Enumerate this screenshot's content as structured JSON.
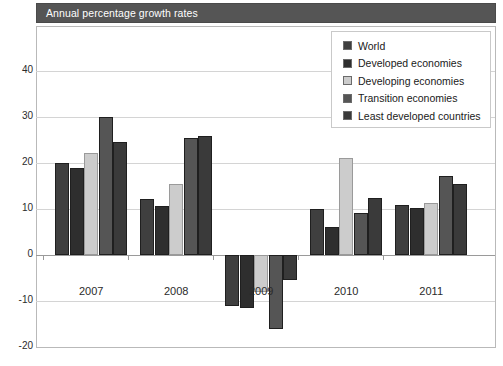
{
  "title": "Annual percentage growth rates",
  "legend": {
    "position": "top-right",
    "items": [
      {
        "label": "World",
        "color": "#3f3f3f"
      },
      {
        "label": "Developed economies",
        "color": "#2e2e2e"
      },
      {
        "label": "Developing economies",
        "color": "#cccccc"
      },
      {
        "label": "Transition economies",
        "color": "#555555"
      },
      {
        "label": "Least developed countries",
        "color": "#3a3a3a"
      }
    ]
  },
  "yticks": [
    "40",
    "30",
    "20",
    "10",
    "0",
    "-10",
    "-20"
  ],
  "xticks": [
    "2007",
    "2008",
    "2009",
    "2010",
    "2011"
  ],
  "chart_data": {
    "type": "bar",
    "title": "Annual percentage growth rates",
    "xlabel": "",
    "ylabel": "",
    "ylim": [
      -20,
      45
    ],
    "ytick_values": [
      40,
      30,
      20,
      10,
      0,
      -10,
      -20
    ],
    "grid": true,
    "legend_position": "top-right",
    "categories": [
      "2007",
      "2008",
      "2009",
      "2010",
      "2011"
    ],
    "series": [
      {
        "name": "World",
        "color": "#3f3f3f",
        "values": [
          20.0,
          12.2,
          -11.0,
          10.0,
          10.9
        ]
      },
      {
        "name": "Developed economies",
        "color": "#2e2e2e",
        "values": [
          18.9,
          10.6,
          -11.6,
          6.0,
          10.3
        ]
      },
      {
        "name": "Developing economies",
        "color": "#cccccc",
        "values": [
          22.2,
          15.5,
          -8.0,
          21.1,
          11.3
        ]
      },
      {
        "name": "Transition economies",
        "color": "#555555",
        "values": [
          30.1,
          25.4,
          -16.0,
          9.1,
          17.1
        ]
      },
      {
        "name": "Least developed countries",
        "color": "#3a3a3a",
        "values": [
          24.6,
          25.9,
          -5.5,
          12.5,
          15.5
        ]
      }
    ]
  }
}
